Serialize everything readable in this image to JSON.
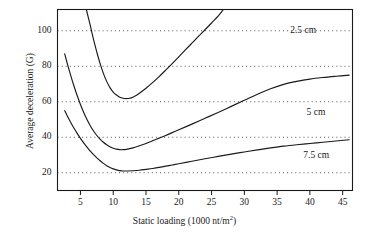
{
  "chart_data": {
    "type": "line",
    "title": "",
    "xlabel": "Static loading (1000 nt/m2)",
    "xlabel_base": "Static loading (1000 nt/m",
    "xlabel_sup": "2",
    "xlabel_tail": ")",
    "ylabel": "Average deceleration (G)",
    "xlim": [
      1.5,
      46.5
    ],
    "ylim": [
      10,
      112
    ],
    "grid": "horizontal-dotted",
    "legend": "inline-curve-labels",
    "xticks": [
      5,
      10,
      15,
      20,
      25,
      30,
      35,
      40,
      45
    ],
    "xtick_labels": [
      "5",
      "10",
      "15",
      "20",
      "25",
      "30",
      "35",
      "40",
      "45"
    ],
    "yticks": [
      20,
      40,
      60,
      80,
      100
    ],
    "ytick_labels": [
      "20",
      "40",
      "60",
      "80",
      "100"
    ],
    "line_color": "#1a1a1a",
    "grid_color": "#555555",
    "axis_color": "#1a1a1a",
    "series": [
      {
        "name": "2.5 cm",
        "label": "2.5 cm",
        "label_x": 37.0,
        "label_y": 100.5,
        "points": [
          [
            5.9,
            112
          ],
          [
            6.5,
            103
          ],
          [
            7.0,
            95
          ],
          [
            7.5,
            88
          ],
          [
            8.0,
            81.5
          ],
          [
            8.5,
            76
          ],
          [
            9.0,
            71.5
          ],
          [
            9.5,
            68
          ],
          [
            10.0,
            65.5
          ],
          [
            10.5,
            63.8
          ],
          [
            11.0,
            62.6
          ],
          [
            11.5,
            62.0
          ],
          [
            12.0,
            61.8
          ],
          [
            12.5,
            62.0
          ],
          [
            13.0,
            62.6
          ],
          [
            13.5,
            63.6
          ],
          [
            14.0,
            64.8
          ],
          [
            15.0,
            67.6
          ],
          [
            16.0,
            70.8
          ],
          [
            17.0,
            74.2
          ],
          [
            18.0,
            77.8
          ],
          [
            19.0,
            81.5
          ],
          [
            20.0,
            85.3
          ],
          [
            21.0,
            89.2
          ],
          [
            22.0,
            93.0
          ],
          [
            23.0,
            96.8
          ],
          [
            24.0,
            100.6
          ],
          [
            25.0,
            104.4
          ],
          [
            26.0,
            108.2
          ],
          [
            26.8,
            112
          ]
        ]
      },
      {
        "name": "5 cm",
        "label": "5 cm",
        "label_x": 39.5,
        "label_y": 54.0,
        "points": [
          [
            2.6,
            87.0
          ],
          [
            3.0,
            81.5
          ],
          [
            3.5,
            75.0
          ],
          [
            4.0,
            69.0
          ],
          [
            4.5,
            63.5
          ],
          [
            5.0,
            58.5
          ],
          [
            5.5,
            54.0
          ],
          [
            6.0,
            50.0
          ],
          [
            6.5,
            46.5
          ],
          [
            7.0,
            43.5
          ],
          [
            7.5,
            41.0
          ],
          [
            8.0,
            39.0
          ],
          [
            8.5,
            37.2
          ],
          [
            9.0,
            35.8
          ],
          [
            9.5,
            34.6
          ],
          [
            10.0,
            33.8
          ],
          [
            10.5,
            33.3
          ],
          [
            11.0,
            33.0
          ],
          [
            11.5,
            33.0
          ],
          [
            12.0,
            33.2
          ],
          [
            13.0,
            34.0
          ],
          [
            14.0,
            35.2
          ],
          [
            15.0,
            36.5
          ],
          [
            16.0,
            38.0
          ],
          [
            17.0,
            39.5
          ],
          [
            18.0,
            41.0
          ],
          [
            19.0,
            42.6
          ],
          [
            20.0,
            44.2
          ],
          [
            22.0,
            47.4
          ],
          [
            24.0,
            50.7
          ],
          [
            26.0,
            54.0
          ],
          [
            28.0,
            57.4
          ],
          [
            30.0,
            60.8
          ],
          [
            32.0,
            64.2
          ],
          [
            34.0,
            67.3
          ],
          [
            36.0,
            69.8
          ],
          [
            38.0,
            71.5
          ],
          [
            40.0,
            72.8
          ],
          [
            42.0,
            73.7
          ],
          [
            44.0,
            74.4
          ],
          [
            46.0,
            75.0
          ]
        ]
      },
      {
        "name": "7.5 cm",
        "label": "7.5 cm",
        "label_x": 39.0,
        "label_y": 30.0,
        "points": [
          [
            2.6,
            55.0
          ],
          [
            3.0,
            52.0
          ],
          [
            3.5,
            48.5
          ],
          [
            4.0,
            45.2
          ],
          [
            4.5,
            42.2
          ],
          [
            5.0,
            39.4
          ],
          [
            5.5,
            36.8
          ],
          [
            6.0,
            34.4
          ],
          [
            6.5,
            32.2
          ],
          [
            7.0,
            30.2
          ],
          [
            7.5,
            28.4
          ],
          [
            8.0,
            26.8
          ],
          [
            8.5,
            25.3
          ],
          [
            9.0,
            24.0
          ],
          [
            9.5,
            23.0
          ],
          [
            10.0,
            22.2
          ],
          [
            10.5,
            21.6
          ],
          [
            11.0,
            21.2
          ],
          [
            11.5,
            21.0
          ],
          [
            12.0,
            21.0
          ],
          [
            13.0,
            21.1
          ],
          [
            14.0,
            21.4
          ],
          [
            15.0,
            21.9
          ],
          [
            16.0,
            22.4
          ],
          [
            17.0,
            23.0
          ],
          [
            18.0,
            23.7
          ],
          [
            19.0,
            24.4
          ],
          [
            20.0,
            25.1
          ],
          [
            22.0,
            26.5
          ],
          [
            24.0,
            27.9
          ],
          [
            26.0,
            29.2
          ],
          [
            28.0,
            30.5
          ],
          [
            30.0,
            31.7
          ],
          [
            32.0,
            32.9
          ],
          [
            34.0,
            34.0
          ],
          [
            36.0,
            35.0
          ],
          [
            38.0,
            35.8
          ],
          [
            40.0,
            36.5
          ],
          [
            42.0,
            37.2
          ],
          [
            44.0,
            37.9
          ],
          [
            46.0,
            38.6
          ]
        ]
      }
    ]
  }
}
